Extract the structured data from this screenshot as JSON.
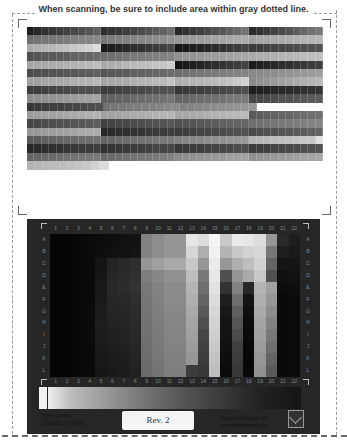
{
  "instruction": "When scanning, be sure to include area within gray dotted line.",
  "top_chart": {
    "rows": [
      [
        28,
        40,
        50,
        55,
        60,
        65,
        72,
        78,
        85,
        95,
        45,
        50,
        55,
        62,
        68,
        75,
        82,
        90,
        98,
        110,
        40,
        48,
        55,
        62,
        70,
        78,
        85,
        95,
        105,
        115,
        42,
        50,
        58,
        66,
        74,
        82,
        92,
        102,
        112,
        120
      ],
      [
        110,
        115,
        118,
        120,
        122,
        125,
        128,
        130,
        132,
        135,
        120,
        125,
        128,
        130,
        132,
        135,
        138,
        140,
        142,
        145,
        150,
        152,
        155,
        158,
        160,
        162,
        165,
        168,
        170,
        172,
        160,
        165,
        168,
        170,
        172,
        175,
        178,
        180,
        182,
        185
      ],
      [
        170,
        175,
        180,
        185,
        190,
        195,
        200,
        205,
        210,
        220,
        25,
        30,
        35,
        40,
        45,
        50,
        55,
        60,
        65,
        70,
        20,
        25,
        30,
        35,
        40,
        45,
        50,
        55,
        60,
        68,
        60,
        62,
        65,
        68,
        70,
        72,
        75,
        78,
        80,
        82
      ],
      [
        80,
        85,
        88,
        90,
        92,
        95,
        98,
        100,
        102,
        105,
        110,
        112,
        115,
        118,
        120,
        122,
        125,
        128,
        130,
        132,
        145,
        148,
        150,
        152,
        155,
        158,
        160,
        162,
        165,
        168,
        170,
        172,
        175,
        178,
        180,
        182,
        185,
        188,
        190,
        192
      ],
      [
        165,
        168,
        170,
        172,
        175,
        178,
        180,
        182,
        185,
        190,
        170,
        175,
        178,
        182,
        185,
        188,
        190,
        195,
        198,
        205,
        20,
        25,
        30,
        35,
        40,
        45,
        50,
        55,
        60,
        65,
        28,
        32,
        36,
        40,
        44,
        48,
        52,
        56,
        60,
        64
      ],
      [
        75,
        78,
        80,
        82,
        84,
        86,
        88,
        90,
        92,
        95,
        85,
        88,
        90,
        92,
        95,
        98,
        100,
        102,
        105,
        108,
        110,
        112,
        115,
        118,
        120,
        122,
        125,
        128,
        130,
        132,
        135,
        138,
        140,
        142,
        145,
        148,
        150,
        152,
        155,
        158
      ],
      [
        160,
        162,
        165,
        168,
        170,
        172,
        175,
        178,
        180,
        185,
        165,
        168,
        170,
        172,
        175,
        178,
        180,
        185,
        188,
        195,
        175,
        178,
        180,
        182,
        185,
        188,
        190,
        195,
        200,
        210,
        140,
        145,
        150,
        155,
        160,
        165,
        170,
        175,
        180,
        185
      ],
      [
        60,
        62,
        65,
        68,
        70,
        72,
        75,
        78,
        80,
        82,
        60,
        62,
        65,
        68,
        70,
        72,
        75,
        78,
        80,
        82,
        55,
        58,
        60,
        62,
        65,
        68,
        70,
        72,
        75,
        78,
        30,
        32,
        35,
        38,
        40,
        42,
        45,
        48,
        50,
        52
      ],
      [
        140,
        142,
        145,
        148,
        150,
        152,
        155,
        158,
        160,
        162,
        95,
        98,
        100,
        102,
        105,
        108,
        110,
        112,
        115,
        118,
        100,
        102,
        105,
        108,
        110,
        112,
        115,
        118,
        120,
        122,
        70,
        72,
        75,
        78,
        80,
        82,
        85,
        88,
        90,
        92
      ],
      [
        55,
        58,
        60,
        62,
        65,
        68,
        70,
        72,
        75,
        78,
        115,
        118,
        120,
        122,
        125,
        128,
        130,
        132,
        135,
        138,
        130,
        132,
        135,
        138,
        140,
        142,
        145,
        148,
        150,
        152
      ],
      [
        155,
        158,
        160,
        162,
        165,
        168,
        170,
        172,
        175,
        178,
        160,
        162,
        165,
        168,
        170,
        172,
        175,
        178,
        180,
        182,
        165,
        168,
        170,
        172,
        175,
        178,
        180,
        182,
        185,
        188,
        90,
        92,
        95,
        98,
        100,
        102,
        105,
        108,
        110,
        112
      ],
      [
        70,
        72,
        75,
        78,
        80,
        82,
        85,
        88,
        90,
        92,
        65,
        68,
        70,
        72,
        75,
        78,
        80,
        82,
        85,
        88,
        80,
        82,
        85,
        88,
        90,
        92,
        95,
        98,
        100,
        102,
        110,
        112,
        115,
        118,
        120,
        122,
        125,
        128,
        130,
        132
      ],
      [
        150,
        152,
        155,
        158,
        160,
        162,
        165,
        168,
        170,
        172,
        40,
        42,
        45,
        48,
        50,
        52,
        55,
        58,
        60,
        62,
        60,
        62,
        65,
        68,
        70,
        72,
        75,
        78,
        80,
        82,
        75,
        78,
        80,
        82,
        85,
        88,
        90,
        92,
        95,
        98
      ],
      [
        90,
        92,
        95,
        98,
        100,
        102,
        105,
        108,
        110,
        112,
        100,
        102,
        105,
        108,
        110,
        112,
        115,
        118,
        120,
        122,
        130,
        132,
        135,
        138,
        140,
        142,
        145,
        148,
        150,
        152,
        180,
        182,
        185,
        188,
        190,
        192,
        195,
        198,
        200,
        225
      ],
      [
        40,
        42,
        45,
        48,
        50,
        52,
        55,
        58,
        60,
        62,
        50,
        52,
        55,
        58,
        60,
        62,
        65,
        68,
        70,
        72,
        55,
        58,
        60,
        62,
        65,
        68,
        70,
        72,
        75,
        78,
        60,
        62,
        65,
        68,
        70,
        72,
        75,
        78,
        80,
        82
      ],
      [
        100,
        102,
        105,
        108,
        110,
        112,
        115,
        118,
        120,
        122,
        105,
        108,
        110,
        112,
        115,
        118,
        120,
        122,
        125,
        128,
        140,
        142,
        145,
        148,
        150,
        152,
        155,
        158,
        160,
        162,
        145,
        148,
        150,
        152,
        155,
        158,
        160,
        162,
        165,
        168
      ],
      [
        180,
        182,
        185,
        188,
        190,
        192,
        195,
        200,
        210,
        220
      ]
    ]
  },
  "target": {
    "col_labels": [
      "1",
      "2",
      "3",
      "4",
      "5",
      "6",
      "7",
      "8",
      "9",
      "10",
      "11",
      "12",
      "13",
      "14",
      "15",
      "16",
      "17",
      "18",
      "19",
      "20",
      "21",
      "22"
    ],
    "row_labels": [
      "A",
      "B",
      "C",
      "D",
      "E",
      "F",
      "G",
      "H",
      "I",
      "J",
      "K",
      "L"
    ],
    "columns": [
      [
        5,
        5,
        5,
        5,
        5,
        5,
        5,
        5,
        5,
        5,
        5,
        5
      ],
      [
        5,
        5,
        5,
        5,
        5,
        5,
        5,
        5,
        5,
        5,
        5,
        5
      ],
      [
        8,
        8,
        8,
        8,
        8,
        8,
        8,
        8,
        8,
        8,
        8,
        8
      ],
      [
        10,
        10,
        10,
        10,
        10,
        10,
        10,
        10,
        10,
        10,
        10,
        10
      ],
      [
        12,
        14,
        20,
        22,
        24,
        26,
        28,
        30,
        28,
        26,
        24,
        22
      ],
      [
        14,
        16,
        35,
        38,
        40,
        38,
        36,
        34,
        32,
        30,
        28,
        26
      ],
      [
        16,
        18,
        40,
        42,
        44,
        40,
        38,
        36,
        34,
        32,
        30,
        28
      ],
      [
        18,
        20,
        45,
        48,
        50,
        46,
        44,
        42,
        40,
        38,
        36,
        34
      ],
      [
        130,
        130,
        150,
        125,
        120,
        118,
        116,
        114,
        112,
        110,
        108,
        106
      ],
      [
        140,
        140,
        160,
        135,
        130,
        128,
        126,
        124,
        122,
        120,
        118,
        116
      ],
      [
        150,
        150,
        170,
        145,
        140,
        138,
        136,
        134,
        132,
        130,
        128,
        126
      ],
      [
        150,
        150,
        170,
        145,
        140,
        138,
        136,
        134,
        132,
        130,
        128,
        126
      ],
      [
        230,
        215,
        200,
        190,
        180,
        175,
        170,
        165,
        160,
        155,
        150,
        60
      ],
      [
        220,
        175,
        150,
        120,
        110,
        100,
        90,
        80,
        70,
        65,
        60,
        55
      ],
      [
        245,
        240,
        235,
        230,
        225,
        220,
        215,
        210,
        205,
        200,
        195,
        190
      ],
      [
        200,
        180,
        150,
        80,
        50,
        30,
        25,
        20,
        18,
        16,
        14,
        12
      ],
      [
        235,
        200,
        175,
        150,
        130,
        110,
        95,
        85,
        75,
        65,
        60,
        55
      ],
      [
        230,
        210,
        190,
        170,
        40,
        20,
        15,
        12,
        10,
        8,
        8,
        8
      ],
      [
        220,
        215,
        210,
        200,
        180,
        175,
        170,
        165,
        160,
        155,
        150,
        145
      ],
      [
        150,
        120,
        100,
        80,
        160,
        150,
        140,
        130,
        120,
        110,
        100,
        90
      ],
      [
        40,
        30,
        20,
        15,
        12,
        10,
        10,
        10,
        10,
        10,
        10,
        10
      ],
      [
        30,
        25,
        20,
        18,
        15,
        12,
        12,
        12,
        12,
        12,
        12,
        12
      ]
    ],
    "revision_label": "Rev. 2",
    "left_footer_text": [
      "IT8.7/2-1993",
      "2009:02:21 IT8-2E"
    ],
    "right_footer_text": [
      "Monaco Systems, Inc.",
      "www.monacosys.com"
    ]
  }
}
